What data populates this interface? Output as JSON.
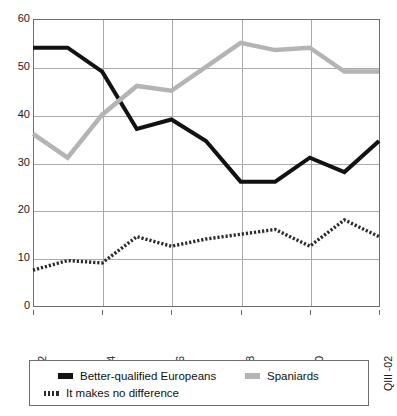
{
  "chart_data": {
    "type": "line",
    "title": "",
    "subtitle": "",
    "xlabel": "",
    "ylabel": "",
    "ylim": [
      0,
      60
    ],
    "ytick_values": [
      0,
      10,
      20,
      30,
      40,
      50,
      60
    ],
    "ytick_labels": [
      "0",
      "10",
      "20",
      "30",
      "40",
      "50",
      "60"
    ],
    "grid": true,
    "legend_position": "bottom",
    "n_points": 11,
    "x_index": [
      0,
      1,
      2,
      3,
      4,
      5,
      6,
      7,
      8,
      9,
      10
    ],
    "xtick_positions": [
      0,
      2,
      4,
      6,
      8,
      10
    ],
    "xtick_labels": [
      "QI-92",
      "QI-94",
      "QIV-96",
      "QIV-98",
      "QIV -00",
      "QIII -02"
    ],
    "categories": [
      "QI-92",
      "",
      "QI-94",
      "",
      "QIV-96",
      "",
      "QIV-98",
      "",
      "QIV -00",
      "",
      "QIII -02"
    ],
    "series": [
      {
        "name": "Better-qualified Europeans",
        "style": "solid",
        "color": "#121212",
        "values": [
          54,
          54,
          49,
          37,
          39,
          34.5,
          26,
          26,
          31,
          28,
          34.5
        ]
      },
      {
        "name": "Spaniards",
        "style": "solid",
        "color": "#b4b4b4",
        "values": [
          36,
          31,
          40,
          46,
          45,
          50,
          55,
          53.5,
          54,
          49,
          49
        ]
      },
      {
        "name": "It makes no difference",
        "style": "dotted",
        "color": "#2b2b2b",
        "values": [
          7.5,
          9.5,
          9,
          14.5,
          12.5,
          14,
          15,
          16,
          12.5,
          18,
          14.5
        ]
      }
    ]
  },
  "legend": {
    "entries": [
      {
        "label": "Better-qualified Europeans",
        "swatch": "sw-black"
      },
      {
        "label": "Spaniards",
        "swatch": "sw-gray"
      },
      {
        "label": "It makes no difference",
        "swatch": "sw-dotted"
      }
    ]
  },
  "colors": {
    "axis": "#6e6e6e",
    "grid": "#a9a9a9",
    "background": "#ffffff"
  }
}
